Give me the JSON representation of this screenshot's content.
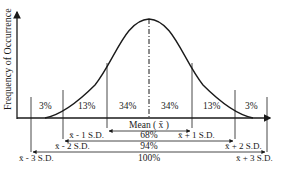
{
  "diagram": {
    "y_axis_label": "Frequency of Occurrence",
    "mean_label": "Mean ( x̄ )",
    "region_percents": [
      "3%",
      "13%",
      "34%",
      "34%",
      "13%",
      "3%"
    ],
    "sd_labels": {
      "minus1": "x̄ - 1 S.D.",
      "plus1": "x̄ + 1 S.D.",
      "minus2": "x̄ - 2 S.D.",
      "plus2": "x̄ + 2 S.D.",
      "minus3": "x̄ - 3 S.D.",
      "plus3": "x̄ + 3 S.D."
    },
    "band_percents": {
      "one_sd": "68%",
      "two_sd": "94%",
      "three_sd": "100%"
    },
    "colors": {
      "line": "#1a1a1a",
      "background": "#ffffff"
    }
  }
}
